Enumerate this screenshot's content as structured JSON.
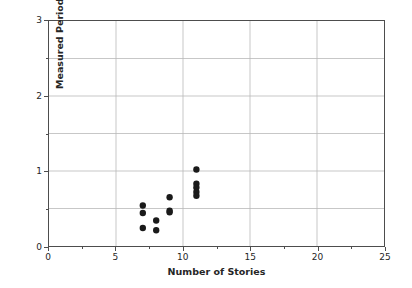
{
  "chart_data": {
    "type": "scatter",
    "title": "",
    "xlabel": "Number of Stories",
    "ylabel": "Measured Period, [sec]",
    "xlim": [
      0,
      25
    ],
    "ylim": [
      0,
      3
    ],
    "xticks": [
      0,
      5,
      10,
      15,
      20,
      25
    ],
    "xtick_labels": [
      "0",
      "5",
      "10",
      "15",
      "20",
      "25"
    ],
    "xminor_ticks": [
      2.5,
      7.5,
      12.5,
      17.5,
      22.5
    ],
    "yticks": [
      0,
      1,
      2,
      3
    ],
    "ytick_labels": [
      "0",
      "1",
      "2",
      "3"
    ],
    "yminor_ticks": [
      0.5,
      1.5,
      2.5
    ],
    "grid": true,
    "grid_x": [
      5,
      10,
      15,
      20
    ],
    "grid_y": [
      0.5,
      1,
      1.5,
      2,
      2.5
    ],
    "legend": null,
    "marker": "circle",
    "marker_color": "#1a1a1a",
    "marker_size": 3.2,
    "x": [
      7,
      7,
      7,
      8,
      8,
      9,
      9,
      9,
      11,
      11,
      11,
      11,
      11
    ],
    "y": [
      0.54,
      0.44,
      0.24,
      0.34,
      0.21,
      0.65,
      0.47,
      0.45,
      1.02,
      0.83,
      0.78,
      0.72,
      0.67
    ],
    "points": [
      {
        "x": 7,
        "y": 0.54
      },
      {
        "x": 7,
        "y": 0.44
      },
      {
        "x": 7,
        "y": 0.24
      },
      {
        "x": 8,
        "y": 0.34
      },
      {
        "x": 8,
        "y": 0.21
      },
      {
        "x": 9,
        "y": 0.65
      },
      {
        "x": 9,
        "y": 0.47
      },
      {
        "x": 9,
        "y": 0.45
      },
      {
        "x": 11,
        "y": 1.02
      },
      {
        "x": 11,
        "y": 0.83
      },
      {
        "x": 11,
        "y": 0.78
      },
      {
        "x": 11,
        "y": 0.72
      },
      {
        "x": 11,
        "y": 0.67
      }
    ]
  },
  "colors": {
    "background": "#ffffff",
    "axis": "#4d4d4d",
    "grid": "#b8b8b8",
    "marker": "#1a1a1a",
    "text": "#262626"
  }
}
